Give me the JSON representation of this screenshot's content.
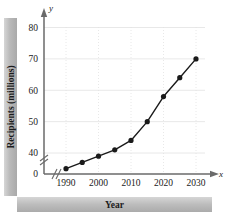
{
  "chart_data": {
    "type": "line",
    "title": "",
    "xlabel": "Year",
    "ylabel": "Recipients (millions)",
    "x": [
      1990,
      1995,
      2000,
      2005,
      2010,
      2015,
      2020,
      2025,
      2030
    ],
    "values": [
      35,
      37,
      39,
      41,
      44,
      50,
      58,
      64,
      70
    ],
    "series": [
      {
        "name": "Recipients",
        "values": [
          35,
          37,
          39,
          41,
          44,
          50,
          58,
          64,
          70
        ]
      }
    ],
    "xlim": [
      1988,
      2032
    ],
    "ylim": [
      33,
      82
    ],
    "xtick_labels": [
      "1990",
      "2000",
      "2010",
      "2020",
      "2030"
    ],
    "xtick_values": [
      1990,
      2000,
      2010,
      2020,
      2030
    ],
    "ytick_labels": [
      "0",
      "40",
      "50",
      "60",
      "70",
      "80"
    ],
    "ytick_values": [
      0,
      40,
      50,
      60,
      70,
      80
    ],
    "grid": true,
    "legend": false,
    "legend_position": "none",
    "axis_break_y": true,
    "axis_break_x": true,
    "marker": "filled-circle",
    "line_color": "#1a1a1a",
    "marker_color": "#1a1a1a",
    "grid_color": "#e2e2e2",
    "axis_color": "#6a6a6a",
    "band_color": "#b9b9b9"
  },
  "axes": {
    "x_axis_symbol": "x",
    "y_axis_symbol": "y"
  }
}
